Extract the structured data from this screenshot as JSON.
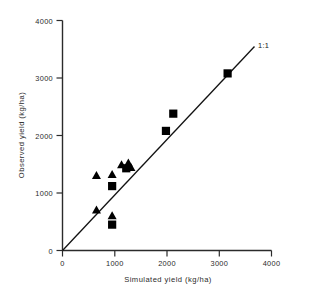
{
  "chart_data": {
    "type": "scatter",
    "title": "",
    "xlabel": "Simulated yield (kg/ha)",
    "ylabel": "Observed yield (kg/ha)",
    "xlim": [
      0,
      4000
    ],
    "ylim": [
      0,
      4000
    ],
    "xticks": [
      0,
      1000,
      2000,
      3000,
      4000
    ],
    "yticks": [
      0,
      1000,
      2000,
      3000,
      4000
    ],
    "xtick_labels": [
      "0",
      "1000",
      "2000",
      "3000",
      "4000"
    ],
    "ytick_labels": [
      "0",
      "1000",
      "2000",
      "3000",
      "4000"
    ],
    "grid": false,
    "legend_position": "none",
    "annotations": [
      {
        "text": "1:1",
        "x": 3770,
        "y": 3580,
        "description": "one-to-one line label"
      }
    ],
    "reference_line": {
      "name": "1:1 line",
      "label": "1:1",
      "x": [
        0,
        3680
      ],
      "y": [
        0,
        3545
      ],
      "color": "#111111"
    },
    "series": [
      {
        "name": "triangles",
        "marker": "triangle",
        "color": "#000000",
        "points": [
          {
            "x": 650,
            "y": 1300
          },
          {
            "x": 950,
            "y": 1320
          },
          {
            "x": 1130,
            "y": 1490
          },
          {
            "x": 1260,
            "y": 1520
          },
          {
            "x": 1310,
            "y": 1440
          },
          {
            "x": 650,
            "y": 700
          },
          {
            "x": 950,
            "y": 600
          }
        ]
      },
      {
        "name": "squares",
        "marker": "square",
        "color": "#000000",
        "points": [
          {
            "x": 950,
            "y": 1120
          },
          {
            "x": 950,
            "y": 450
          },
          {
            "x": 1220,
            "y": 1430
          },
          {
            "x": 1980,
            "y": 2080
          },
          {
            "x": 2120,
            "y": 2380
          },
          {
            "x": 3160,
            "y": 3080
          }
        ]
      }
    ]
  },
  "axes": {
    "x_title": "Simulated yield (kg/ha)",
    "y_title": "Observed yield (kg/ha)",
    "x_tick_0": "0",
    "x_tick_1": "1000",
    "x_tick_2": "2000",
    "x_tick_3": "3000",
    "x_tick_4": "4000",
    "y_tick_0": "0",
    "y_tick_1": "1000",
    "y_tick_2": "2000",
    "y_tick_3": "3000",
    "y_tick_4": "4000"
  },
  "labels": {
    "one_to_one": "1:1"
  }
}
